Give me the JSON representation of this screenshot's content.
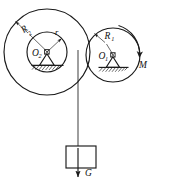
{
  "figure": {
    "type": "mechanics-diagram",
    "background_color": "#ffffff",
    "line_color": "#1a1a1a"
  },
  "labels": {
    "outer_radius_left": "R",
    "outer_radius_left_sub": "2",
    "inner_radius_left": "r",
    "center_left": "O",
    "center_left_sub": "2",
    "radius_right": "R",
    "radius_right_sub": "1",
    "center_right": "O",
    "center_right_sub": "1",
    "moment": "M",
    "weight": "G"
  },
  "elements": {
    "left_pulley": {
      "name": "stepped-pulley-O2",
      "center_x": 47,
      "center_y": 52,
      "outer_radius": 43,
      "inner_radius": 20
    },
    "right_pulley": {
      "name": "pulley-O1",
      "center_x": 113,
      "center_y": 55,
      "radius": 27
    },
    "cord": {
      "name": "vertical-cord",
      "x": 78,
      "from_y": 52,
      "to_y": 146
    },
    "block": {
      "name": "hanging-block",
      "x": 66,
      "y": 146,
      "width": 30,
      "height": 22
    },
    "weight_arrow": {
      "name": "weight-arrow-G",
      "from_y": 148,
      "to_y": 178
    }
  }
}
